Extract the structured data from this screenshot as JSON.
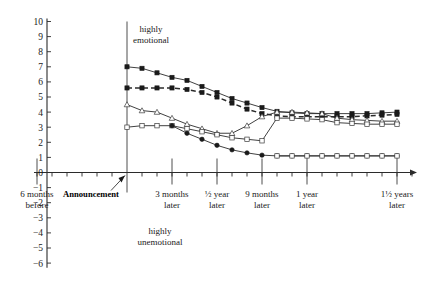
{
  "chart_data": {
    "type": "line",
    "title": "",
    "xlabel": "",
    "ylabel": "",
    "ylim": [
      -6,
      10
    ],
    "xlim": [
      -6,
      20
    ],
    "grid": false,
    "legend_position": "none",
    "y_ticks": [
      "10",
      "9",
      "8",
      "7",
      "6",
      "5",
      "4",
      "3",
      "2",
      "1",
      "0",
      "-1",
      "-2",
      "-3",
      "-4",
      "-5",
      "-6"
    ],
    "y_tick_values": [
      10,
      9,
      8,
      7,
      6,
      5,
      4,
      3,
      2,
      1,
      0,
      -1,
      -2,
      -3,
      -4,
      -5,
      -6
    ],
    "x_tick_labels": [
      {
        "label": "6 months\nbefore",
        "line1": "6 months",
        "line2": "before",
        "x": -6
      },
      {
        "label": "Announcement",
        "line1": "Announcement",
        "line2": "",
        "x": 0
      },
      {
        "label": "3 months\nlater",
        "line1": "3 months",
        "line2": "later",
        "x": 3
      },
      {
        "label": "½ year\nlater",
        "line1": "½ year",
        "line2": "later",
        "x": 6
      },
      {
        "label": "9 months\nlater",
        "line1": "9 months",
        "line2": "later",
        "x": 9
      },
      {
        "label": "1 year\nlater",
        "line1": "1 year",
        "line2": "later",
        "x": 12
      },
      {
        "label": "1½ years\nlater",
        "line1": "1½ years",
        "line2": "later",
        "x": 18
      }
    ],
    "annotations": [
      {
        "name": "highly-emotional",
        "line1": "highly",
        "line2": "emotional",
        "x": 1.6,
        "y": 9.3
      },
      {
        "name": "highly-unemotional",
        "line1": "highly",
        "line2": "unemotional",
        "x": 2.2,
        "y": -4.1
      }
    ],
    "series": [
      {
        "name": "series-filled-square",
        "marker": "filled-square",
        "style": "solid",
        "x": [
          0,
          1,
          2,
          3,
          4,
          5,
          6,
          7,
          8,
          9,
          10,
          11,
          12,
          13,
          14,
          15,
          16,
          17,
          18
        ],
        "values": [
          7.0,
          6.9,
          6.6,
          6.3,
          6.1,
          5.7,
          5.3,
          4.9,
          4.6,
          4.3,
          4.05,
          3.95,
          3.9,
          3.9,
          3.9,
          3.9,
          3.9,
          3.95,
          4.0
        ]
      },
      {
        "name": "series-dashed",
        "marker": "filled-square",
        "style": "dashed",
        "x": [
          0,
          1,
          2,
          3,
          4,
          5,
          6,
          7,
          8,
          9,
          10,
          11,
          12,
          13,
          14,
          15,
          16,
          17,
          18
        ],
        "values": [
          5.6,
          5.6,
          5.6,
          5.6,
          5.5,
          5.3,
          5.0,
          4.6,
          4.2,
          3.9,
          3.75,
          3.7,
          3.7,
          3.7,
          3.7,
          3.7,
          3.75,
          3.8,
          3.85
        ]
      },
      {
        "name": "series-open-triangle",
        "marker": "open-triangle",
        "style": "solid",
        "x": [
          0,
          1,
          2,
          3,
          4,
          5,
          6,
          7,
          8,
          9,
          10,
          11,
          12,
          13,
          14,
          15,
          16,
          17,
          18
        ],
        "values": [
          4.5,
          4.1,
          4.0,
          3.6,
          3.2,
          2.9,
          2.6,
          2.6,
          3.1,
          3.7,
          4.0,
          4.0,
          3.95,
          3.9,
          3.6,
          3.5,
          3.45,
          3.4,
          3.4
        ]
      },
      {
        "name": "series-open-square",
        "marker": "open-square",
        "style": "solid",
        "x": [
          0,
          1,
          2,
          3,
          4,
          5,
          6,
          7,
          8,
          9,
          10,
          11,
          12,
          13,
          14,
          15,
          16,
          17,
          18
        ],
        "values": [
          3.0,
          3.1,
          3.1,
          3.1,
          2.9,
          2.7,
          2.5,
          2.3,
          2.2,
          2.1,
          3.6,
          3.6,
          3.55,
          3.5,
          3.3,
          3.25,
          3.2,
          3.2,
          3.2
        ]
      },
      {
        "name": "series-filled-circle",
        "marker": "filled-circle",
        "style": "solid",
        "x": [
          3,
          4,
          5,
          6,
          7,
          8,
          9,
          10,
          11,
          12,
          13,
          14,
          15,
          16,
          17,
          18
        ],
        "values": [
          3.1,
          2.6,
          2.2,
          1.8,
          1.5,
          1.3,
          1.15,
          1.1,
          1.1,
          1.1,
          1.1,
          1.1,
          1.1,
          1.1,
          1.1,
          1.1
        ]
      },
      {
        "name": "series-flat-open-square",
        "marker": "open-square",
        "style": "solid",
        "x": [
          10,
          11,
          12,
          13,
          14,
          15,
          16,
          17,
          18
        ],
        "values": [
          1.1,
          1.1,
          1.1,
          1.1,
          1.1,
          1.1,
          1.1,
          1.1,
          1.1
        ]
      }
    ]
  }
}
